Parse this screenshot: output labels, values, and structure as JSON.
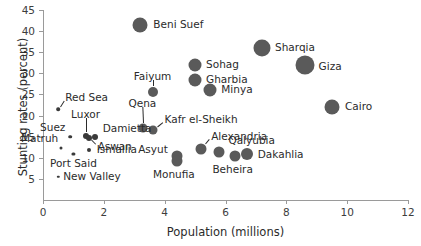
{
  "chart_data": {
    "type": "scatter",
    "title": "",
    "xlabel": "Population (millions)",
    "ylabel": "Stunting rates (percent)",
    "xlim": [
      0,
      12
    ],
    "ylim": [
      0,
      45
    ],
    "xticks": [
      0,
      2,
      4,
      6,
      8,
      10,
      12
    ],
    "yticks": [
      5,
      10,
      15,
      20,
      25,
      30,
      35,
      40,
      45
    ],
    "grid": false,
    "legend": "none",
    "marker_color": "#5a5a5a",
    "marker_note": "bubble size scales with population",
    "points": [
      {
        "label": "Beni Suef",
        "x": 3.2,
        "y": 41.5,
        "r": 7.5,
        "lx": 13,
        "ly": 0,
        "anchor": "start"
      },
      {
        "label": "Sharqia",
        "x": 7.2,
        "y": 36.0,
        "r": 8.5,
        "lx": 13,
        "ly": 0,
        "anchor": "start"
      },
      {
        "label": "Giza",
        "x": 8.6,
        "y": 32.0,
        "r": 9.5,
        "lx": 14,
        "ly": 2,
        "anchor": "start"
      },
      {
        "label": "Sohag",
        "x": 5.0,
        "y": 32.0,
        "r": 6.5,
        "lx": 11,
        "ly": 0,
        "anchor": "start"
      },
      {
        "label": "Gharbia",
        "x": 5.0,
        "y": 28.5,
        "r": 6.5,
        "lx": 11,
        "ly": 0,
        "anchor": "start"
      },
      {
        "label": "Minya",
        "x": 5.5,
        "y": 26.0,
        "r": 6.5,
        "lx": 11,
        "ly": 0,
        "anchor": "start"
      },
      {
        "label": "Faiyum",
        "x": 3.6,
        "y": 25.5,
        "r": 5.0,
        "lx": 0,
        "ly": -15,
        "anchor": "mid"
      },
      {
        "label": "Cairo",
        "x": 9.5,
        "y": 22.0,
        "r": 7.5,
        "lx": 13,
        "ly": 0,
        "anchor": "start"
      },
      {
        "label": "Red Sea",
        "x": 0.5,
        "y": 21.5,
        "r": 1.8,
        "lx": 7,
        "ly": -11,
        "anchor": "start"
      },
      {
        "label": "Qena",
        "x": 3.3,
        "y": 17.0,
        "r": 4.5,
        "lx": -1,
        "ly": -24,
        "anchor": "mid"
      },
      {
        "label": "Kafr el-Sheikh",
        "x": 3.6,
        "y": 16.5,
        "r": 4.5,
        "lx": 12,
        "ly": -10,
        "anchor": "start"
      },
      {
        "label": "Damietta",
        "x": 1.7,
        "y": 15.0,
        "r": 3.0,
        "lx": 8,
        "ly": -8,
        "anchor": "start"
      },
      {
        "label": "Luxor",
        "x": 1.4,
        "y": 15.2,
        "r": 3.0,
        "lx": 0,
        "ly": -21,
        "anchor": "mid"
      },
      {
        "label": "Aswan",
        "x": 1.5,
        "y": 14.8,
        "r": 3.0,
        "lx": 9,
        "ly": 9,
        "anchor": "start"
      },
      {
        "label": "Suez",
        "x": 0.9,
        "y": 15.0,
        "r": 1.8,
        "lx": -5,
        "ly": -9,
        "anchor": "end"
      },
      {
        "label": "Alexandria",
        "x": 5.2,
        "y": 12.0,
        "r": 5.5,
        "lx": 10,
        "ly": -12,
        "anchor": "start"
      },
      {
        "label": "Matruh",
        "x": 0.6,
        "y": 12.3,
        "r": 1.5,
        "lx": -3,
        "ly": -9,
        "anchor": "end"
      },
      {
        "label": "Ismailia",
        "x": 1.5,
        "y": 11.8,
        "r": 2.0,
        "lx": 8,
        "ly": 0,
        "anchor": "start"
      },
      {
        "label": "Qalyubia",
        "x": 5.8,
        "y": 11.3,
        "r": 5.5,
        "lx": 9,
        "ly": -11,
        "anchor": "start"
      },
      {
        "label": "Dakahlia",
        "x": 6.7,
        "y": 10.8,
        "r": 6.0,
        "lx": 11,
        "ly": 1,
        "anchor": "start"
      },
      {
        "label": "Asyut",
        "x": 4.4,
        "y": 10.5,
        "r": 5.5,
        "lx": -9,
        "ly": -6,
        "anchor": "end"
      },
      {
        "label": "Port Said",
        "x": 1.0,
        "y": 11.0,
        "r": 1.6,
        "lx": 0,
        "ly": 10,
        "anchor": "mid"
      },
      {
        "label": "Beheira",
        "x": 6.3,
        "y": 10.5,
        "r": 5.5,
        "lx": -2,
        "ly": 14,
        "anchor": "mid"
      },
      {
        "label": "Monufia",
        "x": 4.4,
        "y": 9.3,
        "r": 5.5,
        "lx": -3,
        "ly": 14,
        "anchor": "mid"
      },
      {
        "label": "New Valley",
        "x": 0.5,
        "y": 5.5,
        "r": 1.2,
        "lx": 5,
        "ly": 0,
        "anchor": "start"
      }
    ]
  },
  "axes": {
    "xlabel": "Population (millions)",
    "ylabel": "Stunting rates (percent)"
  }
}
